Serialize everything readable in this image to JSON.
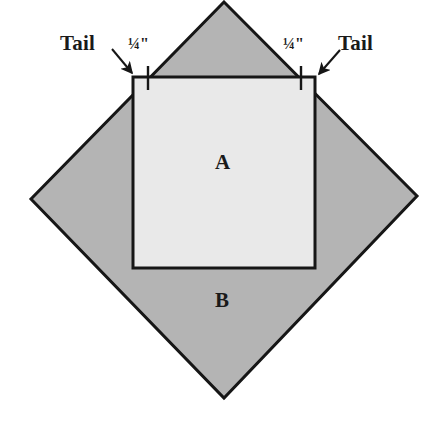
{
  "figure": {
    "colors": {
      "background": "#ffffff",
      "square_a_fill": "#e9e9e9",
      "diamond_b_fill": "#b4b4b4",
      "outline": "#161616",
      "text": "#1a1a1a"
    },
    "shapes": {
      "diamond_b": {
        "name": "B",
        "points": "224,2 417,196 224,398 31,199"
      },
      "square_a": {
        "name": "A",
        "x": 133,
        "y": 77,
        "width": 182,
        "height": 191
      }
    },
    "ticks": [
      {
        "name": "left-quarter-inch-tick",
        "x": 148,
        "y1": 66,
        "y2": 90
      },
      {
        "name": "right-quarter-inch-tick",
        "x": 301,
        "y1": 66,
        "y2": 90
      }
    ],
    "arrows": [
      {
        "name": "left-tail-arrow",
        "x1": 112,
        "y1": 50,
        "x2": 133,
        "y2": 75
      },
      {
        "name": "right-tail-arrow",
        "x1": 339,
        "y1": 51,
        "x2": 317,
        "y2": 75
      }
    ]
  },
  "labels": {
    "tail_left": "Tail",
    "tail_right": "Tail",
    "quarter_inch_left": "¼\"",
    "quarter_inch_right": "¼\"",
    "region_a": "A",
    "region_b": "B"
  }
}
